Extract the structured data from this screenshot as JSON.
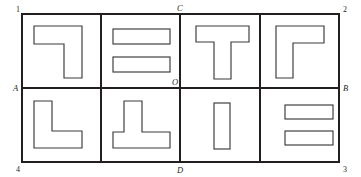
{
  "figure": {
    "outer_rect": {
      "x": 22,
      "y": 14,
      "width": 317,
      "height": 148
    },
    "colors": {
      "grid_stroke": "#231f20",
      "piece_stroke": "#3a3a3c",
      "piece_fill": "#ffffff",
      "background": "#ffffff",
      "label_color": "#231f20"
    },
    "corner_labels": [
      {
        "name": "corner-label-1",
        "text": "1",
        "x": 16,
        "y": 12
      },
      {
        "name": "corner-label-2",
        "text": "2",
        "x": 343,
        "y": 12
      },
      {
        "name": "corner-label-3",
        "text": "3",
        "x": 343,
        "y": 172
      },
      {
        "name": "corner-label-4",
        "text": "4",
        "x": 16,
        "y": 172
      }
    ],
    "midpoint_labels": [
      {
        "name": "midpoint-label-a",
        "text": "A",
        "x": 13,
        "y": 91
      },
      {
        "name": "midpoint-label-b",
        "text": "B",
        "x": 343,
        "y": 91
      },
      {
        "name": "midpoint-label-c",
        "text": "C",
        "x": 177,
        "y": 11
      },
      {
        "name": "midpoint-label-d",
        "text": "D",
        "x": 177,
        "y": 173
      },
      {
        "name": "midpoint-label-o",
        "text": "O",
        "x": 172,
        "y": 85
      }
    ],
    "grid": {
      "rows": 2,
      "columns": 4,
      "vertical_dividers_x": [
        101,
        180,
        260
      ],
      "horizontal_divider_y": 88,
      "axis_note": "A-B horizontal through O, C-D vertical through O"
    },
    "cells": [
      {
        "name": "cell-top-1",
        "index": 1,
        "row": "top",
        "column": 1,
        "piece_name": "mirrored-l-piece",
        "piece_shape": "corner-top-bar-with-right-stem",
        "points": "34,26 82,26 82,78 64,78 64,44 34,44"
      },
      {
        "name": "cell-top-2",
        "index": 2,
        "row": "top",
        "column": 2,
        "piece_name": "double-horizontal-bar-piece",
        "piece_shape": "two-stacked-horizontal-bars",
        "bars": [
          {
            "x": 113,
            "y": 29,
            "width": 57,
            "height": 15
          },
          {
            "x": 113,
            "y": 57,
            "width": 57,
            "height": 15
          }
        ]
      },
      {
        "name": "cell-top-3",
        "index": 3,
        "row": "top",
        "column": 3,
        "piece_name": "t-piece",
        "piece_shape": "t-upright",
        "points": "196,26 249,26 249,42 231,42 231,79 214,79 214,42 196,42"
      },
      {
        "name": "cell-top-4",
        "index": 4,
        "row": "top",
        "column": 4,
        "piece_name": "gamma-piece",
        "piece_shape": "corner-top-bar-with-left-stem",
        "points": "276,26 324,26 324,43 293,43 293,78 276,78"
      },
      {
        "name": "cell-bottom-1",
        "index": 5,
        "row": "bottom",
        "column": 1,
        "piece_name": "l-piece",
        "piece_shape": "l-upright",
        "points": "34,101 52,101 52,131 82,131 82,148 34,148"
      },
      {
        "name": "cell-bottom-2",
        "index": 6,
        "row": "bottom",
        "column": 2,
        "piece_name": "inverted-t-piece",
        "piece_shape": "t-inverted",
        "points": "124,101 142,101 142,132 170,132 170,148 113,148 113,132 124,132"
      },
      {
        "name": "cell-bottom-3",
        "index": 7,
        "row": "bottom",
        "column": 3,
        "piece_name": "vertical-bar-piece",
        "piece_shape": "single-vertical-bar",
        "bars": [
          {
            "x": 214,
            "y": 103,
            "width": 16,
            "height": 46
          }
        ]
      },
      {
        "name": "cell-bottom-4",
        "index": 8,
        "row": "bottom",
        "column": 4,
        "piece_name": "double-horizontal-bar-piece-small",
        "piece_shape": "two-stacked-horizontal-bars",
        "bars": [
          {
            "x": 285,
            "y": 105,
            "width": 48,
            "height": 14
          },
          {
            "x": 285,
            "y": 131,
            "width": 48,
            "height": 14
          }
        ]
      }
    ]
  }
}
